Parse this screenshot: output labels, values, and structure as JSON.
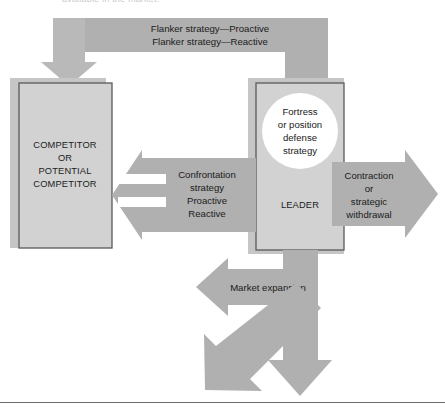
{
  "figure": {
    "clipped_header_text": "available in the market.",
    "colors": {
      "band_gray": "#b0b0b0",
      "box_fill": "#d2d2d2",
      "box_border": "#5a5a5a",
      "shadow_gray": "#c6c6c6",
      "circle_fill": "#ffffff",
      "text": "#1b1b1b",
      "rule": "#6b6b6b",
      "page_bg": "#ffffff"
    },
    "top_band": {
      "line1": "Flanker strategy—Proactive",
      "line2": "Flanker strategy—Reactive"
    },
    "competitor_box": {
      "line1": "COMPETITOR",
      "line2": "OR",
      "line3": "POTENTIAL",
      "line4": "COMPETITOR"
    },
    "leader_box": {
      "circle": {
        "line1": "Fortress",
        "line2": "or position",
        "line3": "defense",
        "line4": "strategy"
      },
      "label": "LEADER"
    },
    "confrontation_band": {
      "line1": "Confrontation",
      "line2": "strategy",
      "line3": "Proactive",
      "line4": "Reactive"
    },
    "right_arrow": {
      "line1": "Contraction",
      "line2": "or",
      "line3": "strategic",
      "line4": "withdrawal"
    },
    "market_expansion_arrow": {
      "label": "Market expansion"
    },
    "diagonal_arrow": {
      "label": ""
    },
    "down_arrow": {
      "label": ""
    }
  }
}
